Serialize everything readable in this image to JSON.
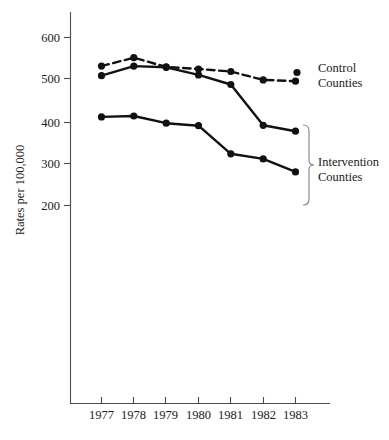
{
  "chart_data": {
    "type": "line",
    "title": "",
    "xlabel": "",
    "ylabel": "Rates per 100,000",
    "x": [
      1977,
      1978,
      1979,
      1980,
      1981,
      1982,
      1983
    ],
    "categories": [
      "1977",
      "1978",
      "1979",
      "1980",
      "1981",
      "1982",
      "1983"
    ],
    "xtick_labels": [
      "1977",
      "1978",
      "1979",
      "1980",
      "1981",
      "1982",
      "1983"
    ],
    "ytick_labels": [
      "600",
      "500",
      "400",
      "300",
      "200"
    ],
    "yticks": [
      600,
      500,
      400,
      300,
      200
    ],
    "ylim": [
      100,
      630
    ],
    "xlim": [
      1976.4,
      1983.9
    ],
    "grid": false,
    "legend_position": "right",
    "series": [
      {
        "name": "Control Counties",
        "style": "dashed",
        "marker": "filled-circle",
        "color": "#111111",
        "values": [
          532,
          552,
          530,
          525,
          519,
          499,
          496
        ]
      },
      {
        "name": "Intervention Counties (upper)",
        "style": "solid",
        "marker": "filled-circle",
        "color": "#111111",
        "values": [
          509,
          532,
          529,
          511,
          488,
          391,
          377
        ]
      },
      {
        "name": "Intervention Counties (lower)",
        "style": "solid",
        "marker": "filled-circle",
        "color": "#111111",
        "values": [
          411,
          413,
          396,
          390,
          323,
          311,
          280
        ]
      }
    ],
    "annotations": [
      {
        "id": "control-label",
        "text": "Control\nCounties",
        "line1": "Control",
        "line2": "Counties"
      },
      {
        "id": "intervention-label",
        "text": "Intervention\nCounties",
        "line1": "Intervention",
        "line2": "Counties"
      }
    ]
  },
  "legend": {
    "control": {
      "line1": "Control",
      "line2": "Counties"
    },
    "intervention": {
      "line1": "Intervention",
      "line2": "Counties"
    }
  },
  "axes": {
    "y_title": "Rates per 100,000"
  }
}
